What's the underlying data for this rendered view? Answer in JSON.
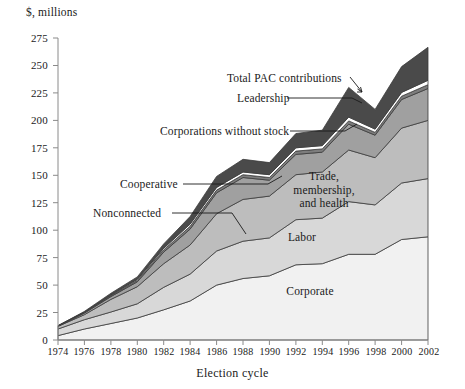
{
  "chart_data": {
    "type": "area",
    "title": "",
    "ylabel": "$, millions",
    "xlabel": "Election cycle",
    "ylim": [
      0,
      275
    ],
    "ytick_values": [
      0,
      25,
      50,
      75,
      100,
      125,
      150,
      175,
      200,
      225,
      250,
      275
    ],
    "grid": false,
    "legend_position": "inline-annotations",
    "x": [
      1974,
      1976,
      1978,
      1980,
      1982,
      1984,
      1986,
      1988,
      1990,
      1992,
      1994,
      1996,
      1998,
      2000,
      2002
    ],
    "categories": [
      "1974",
      "1976",
      "1978",
      "1980",
      "1982",
      "1984",
      "1986",
      "1988",
      "1990",
      "1992",
      "1994",
      "1996",
      "1998",
      "2000",
      "2002"
    ],
    "stacked": true,
    "stack_order_bottom_to_top": [
      "Corporate",
      "Labor",
      "Trade, membership, and health",
      "Nonconnected",
      "Cooperative",
      "Corporations without stock",
      "Leadership"
    ],
    "series": [
      {
        "name": "Corporate",
        "values": [
          4.0,
          10.0,
          15.0,
          20.0,
          27.5,
          35.5,
          50.0,
          56.0,
          58.5,
          68.5,
          69.5,
          78.0,
          78.0,
          91.5,
          94.0
        ]
      },
      {
        "name": "Labor",
        "values": [
          6.0,
          8.5,
          10.5,
          13.0,
          20.5,
          24.5,
          31.0,
          34.0,
          34.5,
          41.0,
          41.5,
          48.0,
          45.0,
          51.5,
          53.0
        ]
      },
      {
        "name": "Trade, membership, and health",
        "values": [
          2.5,
          4.5,
          11.5,
          15.5,
          21.5,
          26.5,
          34.0,
          38.0,
          38.0,
          41.0,
          42.0,
          47.0,
          43.0,
          50.0,
          53.0
        ]
      },
      {
        "name": "Nonconnected",
        "values": [
          0.0,
          1.5,
          2.5,
          4.5,
          10.5,
          14.5,
          19.0,
          20.0,
          14.5,
          18.5,
          18.0,
          23.5,
          20.5,
          26.0,
          29.0
        ]
      },
      {
        "name": "Cooperative",
        "values": [
          0.3,
          0.5,
          0.9,
          1.3,
          2.0,
          2.5,
          2.5,
          2.5,
          2.5,
          3.0,
          3.0,
          3.0,
          2.5,
          3.0,
          3.5
        ]
      },
      {
        "name": "Corporations without stock",
        "values": [
          0.2,
          0.4,
          0.7,
          1.0,
          1.5,
          2.0,
          2.5,
          2.5,
          2.5,
          3.0,
          3.0,
          3.5,
          3.0,
          3.5,
          4.0
        ]
      },
      {
        "name": "Leadership",
        "values": [
          0.0,
          0.6,
          1.4,
          2.2,
          4.0,
          7.0,
          10.0,
          11.5,
          11.0,
          13.0,
          14.0,
          27.0,
          18.0,
          23.5,
          30.0
        ]
      }
    ],
    "total_series": {
      "name": "Total PAC contributions",
      "values": [
        13.0,
        26.0,
        42.5,
        57.5,
        87.5,
        112.5,
        149.0,
        164.5,
        161.5,
        188.0,
        191.0,
        230.0,
        210.0,
        249.0,
        266.5
      ]
    },
    "annotations": [
      {
        "label": "Total PAC contributions",
        "type": "arrow-callout"
      },
      {
        "label": "Leadership",
        "type": "leader-line-callout"
      },
      {
        "label": "Corporations without stock",
        "type": "leader-line-callout"
      },
      {
        "label": "Cooperative",
        "type": "leader-line-callout"
      },
      {
        "label": "Nonconnected",
        "type": "leader-line-callout"
      },
      {
        "label": "Trade,\nmembership,\nand health",
        "type": "inline-label"
      },
      {
        "label": "Labor",
        "type": "inline-label"
      },
      {
        "label": "Corporate",
        "type": "inline-label"
      }
    ],
    "colors": {
      "corporate": "#f1f1f1",
      "labor": "#d8d8d8",
      "trade_membership_health": "#bdbdbd",
      "nonconnected": "#a0a0a0",
      "cooperative": "#7d7d7d",
      "corporations_without_stock": "#ffffff",
      "leadership": "#4a4a4a",
      "axis": "#8a8a8a",
      "text": "#1a1a1a"
    }
  },
  "axis": {
    "y_title": "$, millions",
    "x_title": "Election cycle",
    "y_ticks": [
      "275",
      "250",
      "225",
      "200",
      "175",
      "150",
      "125",
      "100",
      "75",
      "50",
      "25",
      "0"
    ],
    "x_ticks": [
      "1974",
      "1976",
      "1978",
      "1980",
      "1982",
      "1984",
      "1986",
      "1988",
      "1990",
      "1992",
      "1994",
      "1996",
      "1998",
      "2000",
      "2002"
    ]
  },
  "callouts": {
    "total": "Total PAC contributions",
    "leadership": "Leadership",
    "corporations_without_stock": "Corporations without stock",
    "cooperative": "Cooperative",
    "nonconnected": "Nonconnected",
    "trade_line1": "Trade,",
    "trade_line2": "membership,",
    "trade_line3": "and health",
    "labor": "Labor",
    "corporate": "Corporate"
  }
}
